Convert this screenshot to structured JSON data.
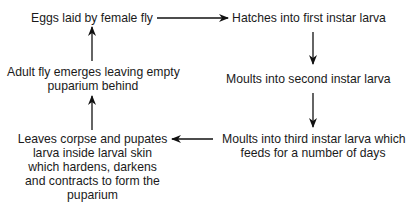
{
  "diagram": {
    "type": "life-cycle flow",
    "nodes": [
      {
        "id": "eggs",
        "lines": [
          "Eggs laid by female fly"
        ]
      },
      {
        "id": "first-instar",
        "lines": [
          "Hatches into first instar larva"
        ]
      },
      {
        "id": "second-instar",
        "lines": [
          "Moults into second instar larva"
        ]
      },
      {
        "id": "third-instar",
        "lines": [
          "Moults into third instar larva which",
          "feeds for a number of days"
        ]
      },
      {
        "id": "pupation",
        "lines": [
          "Leaves corpse and pupates",
          "larva inside larval skin",
          "which hardens, darkens",
          "and contracts to form the",
          "puparium"
        ]
      },
      {
        "id": "adult",
        "lines": [
          "Adult fly emerges leaving empty",
          "puparium behind"
        ]
      }
    ],
    "edges": [
      {
        "from": "eggs",
        "to": "first-instar",
        "direction": "right"
      },
      {
        "from": "first-instar",
        "to": "second-instar",
        "direction": "down"
      },
      {
        "from": "second-instar",
        "to": "third-instar",
        "direction": "down"
      },
      {
        "from": "third-instar",
        "to": "pupation",
        "direction": "left"
      },
      {
        "from": "pupation",
        "to": "adult",
        "direction": "up"
      },
      {
        "from": "adult",
        "to": "eggs",
        "direction": "up"
      }
    ],
    "colors": {
      "text": "#1a1a1a",
      "arrow": "#111111",
      "background": "#ffffff"
    }
  }
}
